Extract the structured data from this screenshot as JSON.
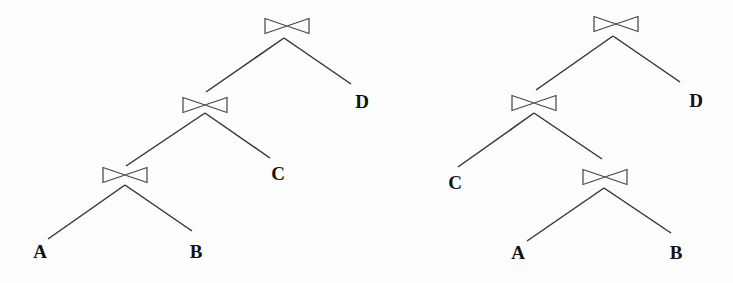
{
  "diagram": {
    "type": "join-trees",
    "operator_icon": "bowtie-join-icon",
    "trees": [
      {
        "name": "left-deep-tree",
        "joins": [
          {
            "id": "j1",
            "x": 287,
            "y": 26,
            "children": [
              "j2",
              "D"
            ]
          },
          {
            "id": "j2",
            "x": 205,
            "y": 105,
            "children": [
              "j3",
              "C"
            ]
          },
          {
            "id": "j3",
            "x": 125,
            "y": 175,
            "children": [
              "A",
              "B"
            ]
          }
        ],
        "leaves": [
          {
            "id": "D",
            "label": "D",
            "x": 362,
            "y": 108
          },
          {
            "id": "C",
            "label": "C",
            "x": 278,
            "y": 180
          },
          {
            "id": "A",
            "label": "A",
            "x": 40,
            "y": 258
          },
          {
            "id": "B",
            "label": "B",
            "x": 196,
            "y": 258
          }
        ],
        "edges": [
          [
            284,
            38,
            206,
            92
          ],
          [
            284,
            38,
            351,
            84
          ],
          [
            205,
            113,
            126,
            166
          ],
          [
            205,
            113,
            270,
            158
          ],
          [
            125,
            185,
            48,
            239
          ],
          [
            125,
            185,
            192,
            231
          ]
        ]
      },
      {
        "name": "bushy-tree",
        "joins": [
          {
            "id": "j1",
            "x": 616,
            "y": 24,
            "children": [
              "j2",
              "D"
            ]
          },
          {
            "id": "j2",
            "x": 534,
            "y": 103,
            "children": [
              "C",
              "j3"
            ]
          },
          {
            "id": "j3",
            "x": 605,
            "y": 177,
            "children": [
              "A",
              "B"
            ]
          }
        ],
        "leaves": [
          {
            "id": "D",
            "label": "D",
            "x": 696,
            "y": 107
          },
          {
            "id": "C",
            "label": "C",
            "x": 455,
            "y": 189
          },
          {
            "id": "A",
            "label": "A",
            "x": 518,
            "y": 259
          },
          {
            "id": "B",
            "label": "B",
            "x": 676,
            "y": 259
          }
        ],
        "edges": [
          [
            613,
            36,
            536,
            90
          ],
          [
            613,
            36,
            680,
            82
          ],
          [
            534,
            113,
            458,
            167
          ],
          [
            534,
            113,
            602,
            159
          ],
          [
            604,
            188,
            527,
            241
          ],
          [
            604,
            188,
            671,
            233
          ]
        ]
      }
    ]
  }
}
